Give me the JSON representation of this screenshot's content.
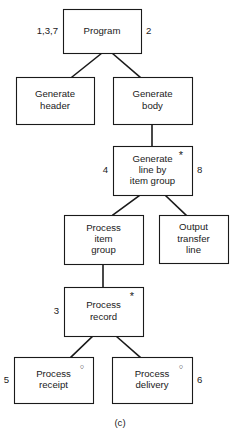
{
  "figure": {
    "caption": "(c)",
    "type": "jackson-structure-diagram",
    "colors": {
      "stroke": "#1a1a1a",
      "fill": "#ffffff",
      "background": "#ffffff"
    }
  },
  "nodes": [
    {
      "id": "program",
      "lines": [
        "Program"
      ],
      "x": 63,
      "y": 9,
      "w": 78,
      "h": 44,
      "marker": "",
      "marker_name": "",
      "left_label": "1,3,7",
      "right_label": "2"
    },
    {
      "id": "generate-header",
      "lines": [
        "Generate",
        "header"
      ],
      "x": 16,
      "y": 77,
      "w": 78,
      "h": 47,
      "marker": "",
      "marker_name": "",
      "left_label": "",
      "right_label": ""
    },
    {
      "id": "generate-body",
      "lines": [
        "Generate",
        "body"
      ],
      "x": 113,
      "y": 77,
      "w": 79,
      "h": 47,
      "marker": "",
      "marker_name": "",
      "left_label": "",
      "right_label": ""
    },
    {
      "id": "generate-line-by-item-group",
      "lines": [
        "Generate",
        "line by",
        "item group"
      ],
      "x": 113,
      "y": 146,
      "w": 79,
      "h": 49,
      "marker": "*",
      "marker_name": "iteration",
      "left_label": "4",
      "right_label": "8"
    },
    {
      "id": "process-item-group",
      "lines": [
        "Process",
        "item",
        "group"
      ],
      "x": 64,
      "y": 215,
      "w": 79,
      "h": 49,
      "marker": "",
      "marker_name": "",
      "left_label": "",
      "right_label": ""
    },
    {
      "id": "output-transfer-line",
      "lines": [
        "Output",
        "transfer",
        "line"
      ],
      "x": 159,
      "y": 215,
      "w": 69,
      "h": 48,
      "marker": "",
      "marker_name": "",
      "left_label": "",
      "right_label": ""
    },
    {
      "id": "process-record",
      "lines": [
        "Process",
        "record"
      ],
      "x": 64,
      "y": 287,
      "w": 79,
      "h": 49,
      "marker": "*",
      "marker_name": "iteration",
      "left_label": "3",
      "right_label": ""
    },
    {
      "id": "process-receipt",
      "lines": [
        "Process",
        "receipt"
      ],
      "x": 14,
      "y": 357,
      "w": 79,
      "h": 46,
      "marker": "○",
      "marker_name": "selection",
      "left_label": "5",
      "right_label": ""
    },
    {
      "id": "process-delivery",
      "lines": [
        "Process",
        "delivery"
      ],
      "x": 112,
      "y": 357,
      "w": 80,
      "h": 46,
      "marker": "○",
      "marker_name": "selection",
      "left_label": "",
      "right_label": "6"
    }
  ],
  "connectors": [
    {
      "id": "program-to-generate-header",
      "from": "program",
      "to": "generate-header",
      "x1": 102,
      "y1": 53,
      "x2": 72,
      "y2": 77
    },
    {
      "id": "program-to-generate-body",
      "from": "program",
      "to": "generate-body",
      "x1": 112,
      "y1": 53,
      "x2": 140,
      "y2": 77
    },
    {
      "id": "generate-body-to-generate-line",
      "from": "generate-body",
      "to": "generate-line-by-item-group",
      "x1": 152,
      "y1": 124,
      "x2": 152,
      "y2": 146
    },
    {
      "id": "generate-line-to-process-item-group",
      "from": "generate-line-by-item-group",
      "to": "process-item-group",
      "x1": 140,
      "y1": 195,
      "x2": 113,
      "y2": 215
    },
    {
      "id": "generate-line-to-output-transfer-line",
      "from": "generate-line-by-item-group",
      "to": "output-transfer-line",
      "x1": 165,
      "y1": 195,
      "x2": 186,
      "y2": 215
    },
    {
      "id": "process-item-group-to-process-record",
      "from": "process-item-group",
      "to": "process-record",
      "x1": 103,
      "y1": 264,
      "x2": 103,
      "y2": 287
    },
    {
      "id": "process-record-to-process-receipt",
      "from": "process-record",
      "to": "process-receipt",
      "x1": 93,
      "y1": 336,
      "x2": 71,
      "y2": 357
    },
    {
      "id": "process-record-to-process-delivery",
      "from": "process-record",
      "to": "process-delivery",
      "x1": 116,
      "y1": 336,
      "x2": 140,
      "y2": 357
    }
  ],
  "caption_position": {
    "x": 120,
    "y": 423
  }
}
